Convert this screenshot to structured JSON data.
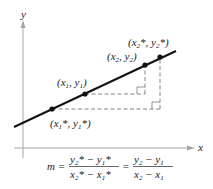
{
  "axes": {
    "x_label": "x",
    "y_label": "y",
    "axis_color": "#a6a6a6"
  },
  "line": {
    "color": "#111111"
  },
  "points": [
    {
      "id": "p1star",
      "label_base": "(x",
      "label": "(x1*, y1*)"
    },
    {
      "id": "p1",
      "label": "(x1, y1)"
    },
    {
      "id": "p2",
      "label": "(x2, y2)"
    },
    {
      "id": "p2star",
      "label": "(x2*, y2*)"
    }
  ],
  "formula": {
    "lhs": "m =",
    "frac1_num": "y2* − y1*",
    "frac1_den": "x2* − x1*",
    "eq": "=",
    "frac2_num": "y2 − y1",
    "frac2_den": "x2 − x1"
  }
}
